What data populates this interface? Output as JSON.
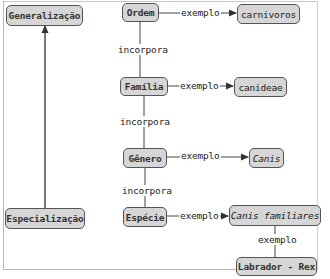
{
  "diagram": {
    "type": "concept-map",
    "nodes": {
      "generalizacao": "Generalização",
      "especializacao": "Especialização",
      "ordem": "Ordem",
      "familia": "Família",
      "genero": "Gênero",
      "especie": "Espécie",
      "carnivoros": "carnivoros",
      "canideae": "canideae",
      "canis": "Canis",
      "canis_familiares": "Canis familiares",
      "labrador_rex": "Labrador - Rex"
    },
    "edges": [
      {
        "from": "Especialização",
        "to": "Generalização",
        "label": ""
      },
      {
        "from": "Ordem",
        "to": "Família",
        "label": "incorpora"
      },
      {
        "from": "Família",
        "to": "Gênero",
        "label": "incorpora"
      },
      {
        "from": "Gênero",
        "to": "Espécie",
        "label": "incorpora"
      },
      {
        "from": "Ordem",
        "to": "carnivoros",
        "label": "exemplo"
      },
      {
        "from": "Família",
        "to": "canideae",
        "label": "exemplo"
      },
      {
        "from": "Gênero",
        "to": "Canis",
        "label": "exemplo"
      },
      {
        "from": "Espécie",
        "to": "Canis familiares",
        "label": "exemplo"
      },
      {
        "from": "Canis familiares",
        "to": "Labrador - Rex",
        "label": "exemplo"
      }
    ],
    "labels": {
      "incorpora_1": "incorpora",
      "incorpora_2": "incorpora",
      "incorpora_3": "incorpora",
      "exemplo_1": "exemplo",
      "exemplo_2": "exemplo",
      "exemplo_3": "exemplo",
      "exemplo_4": "exemplo",
      "exemplo_5": "exemplo"
    },
    "colors": {
      "node_fill": "#d6d6d6",
      "node_border": "#555555",
      "line": "#333333"
    }
  }
}
